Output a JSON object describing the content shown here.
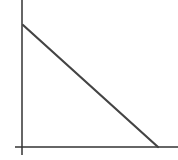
{
  "diagram": {
    "type": "line-graph-sketch",
    "colors": {
      "axis": "#333333",
      "line": "#444444",
      "background": "#ffffff"
    },
    "axes": {
      "x_axis": {
        "x1": 15,
        "y1": 147,
        "x2": 178,
        "y2": 147
      },
      "y_axis": {
        "x1": 22,
        "y1": 0,
        "x2": 22,
        "y2": 155
      }
    },
    "line": {
      "x1": 23,
      "y1": 25,
      "x2": 158,
      "y2": 147
    }
  },
  "chart_data": {
    "type": "line",
    "title": "",
    "xlabel": "",
    "ylabel": "",
    "x": [
      0,
      1
    ],
    "values": [
      1,
      0
    ],
    "grid": false,
    "legend": null,
    "note": "Single straight line with negative slope intersecting the y-axis near the top and the x-axis near the right end; no tick labels shown"
  }
}
